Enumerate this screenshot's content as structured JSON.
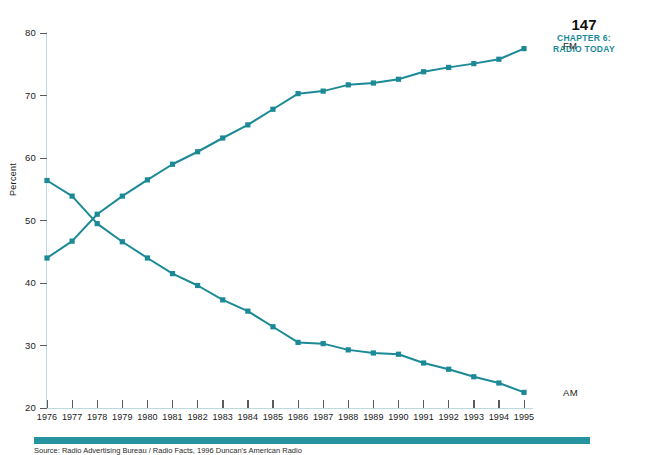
{
  "page_header": {
    "page_number": "147",
    "chapter_line_1": "CHAPTER 6:",
    "chapter_line_2": "RADIO TODAY",
    "accent_color": "#1b8a96"
  },
  "caption": {
    "text": "Source: Radio Advertising Bureau / Radio Facts, 1996 Duncan's American Radio"
  },
  "chart_data": {
    "type": "line",
    "title": "",
    "xlabel": "",
    "ylabel": "Percent",
    "xlim": [
      1976,
      1995
    ],
    "ylim": [
      20,
      80
    ],
    "grid": false,
    "legend_position": "right-end-labels",
    "line_color": "#1b8a96",
    "marker_shape": "square",
    "axis_color": "#bcd9de",
    "x": [
      1976,
      1977,
      1978,
      1979,
      1980,
      1981,
      1982,
      1983,
      1984,
      1985,
      1986,
      1987,
      1988,
      1989,
      1990,
      1991,
      1992,
      1993,
      1994,
      1995
    ],
    "xtick_labels": [
      "1976",
      "1977",
      "1978",
      "1979",
      "1980",
      "1981",
      "1982",
      "1983",
      "1984",
      "1985",
      "1986",
      "1987",
      "1988",
      "1989",
      "1990",
      "1991",
      "1992",
      "1993",
      "1994",
      "1995"
    ],
    "ytick_values": [
      20,
      30,
      40,
      50,
      60,
      70,
      80
    ],
    "ytick_labels": [
      "20",
      "30",
      "40",
      "50",
      "60",
      "70",
      "80"
    ],
    "series": [
      {
        "name": "FM",
        "label": "FM",
        "color": "#1b8a96",
        "values": [
          44.0,
          46.7,
          51.0,
          53.9,
          56.5,
          59.0,
          61.0,
          63.2,
          65.3,
          67.8,
          70.3,
          70.7,
          71.7,
          72.0,
          72.6,
          73.8,
          74.5,
          75.1,
          75.8,
          77.5
        ]
      },
      {
        "name": "AM",
        "label": "AM",
        "color": "#1b8a96",
        "values": [
          56.4,
          53.9,
          49.5,
          46.6,
          44.0,
          41.5,
          39.6,
          37.3,
          35.5,
          33.0,
          30.5,
          30.3,
          29.3,
          28.8,
          28.6,
          27.2,
          26.2,
          25.0,
          24.0,
          22.5
        ]
      }
    ]
  }
}
